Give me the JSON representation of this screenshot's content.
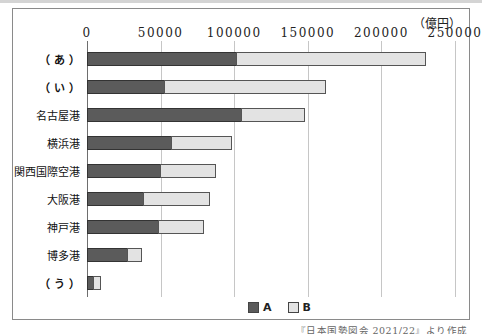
{
  "chart_data": {
    "type": "bar",
    "orientation": "horizontal",
    "stacked": true,
    "title": "",
    "unit_label": "（億円）",
    "xlabel": "",
    "ylabel": "",
    "xlim": [
      0,
      250000
    ],
    "x_ticks": [
      0,
      50000,
      100000,
      150000,
      200000,
      250000
    ],
    "x_tick_labels": [
      "0",
      "50000",
      "100000",
      "150000",
      "200000",
      "250000"
    ],
    "grid": true,
    "legend_position": "bottom",
    "categories": [
      "（ あ ）",
      "（ い ）",
      "名古屋港",
      "横浜港",
      "関西国際空港",
      "大阪港",
      "神戸港",
      "博多港",
      "（ う ）"
    ],
    "bold_categories": [
      true,
      true,
      false,
      false,
      false,
      false,
      false,
      false,
      true
    ],
    "series": [
      {
        "name": "A",
        "color": "#5b5b5b",
        "values": [
          102000,
          53000,
          105000,
          58000,
          50000,
          39000,
          49000,
          28000,
          5000
        ]
      },
      {
        "name": "B",
        "color": "#e3e3e3",
        "values": [
          129000,
          110000,
          44000,
          41000,
          38000,
          45000,
          31000,
          10000,
          5000
        ]
      }
    ],
    "source_note": "『日本国勢図会 2021/22』より作成"
  }
}
